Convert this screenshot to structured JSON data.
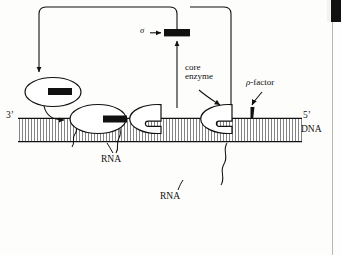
{
  "figure": {
    "background_color": "#fdfdfc",
    "ink_color": "#111111"
  },
  "labels": {
    "sigma": "σ",
    "core_enzyme": "core\nenzyme",
    "core_enzyme_line1": "core",
    "core_enzyme_line2": "enzyme",
    "rho_symbol": "ρ",
    "rho_suffix": "-factor",
    "three_prime": "3’",
    "five_prime": "5’",
    "dna": "DNA",
    "rna_left": "RNA",
    "rna_right": "RNA"
  },
  "elements": {
    "sigma_bar_color": "#111111",
    "rho_wedge_color": "#111111",
    "dna_fill": "#ffffff",
    "dna_rung_color": "#6e6e6e",
    "polymerase_fill": "#ffffff",
    "polymerase_stroke": "#111111"
  },
  "polymerases": [
    {
      "name": "free-holoenzyme",
      "state": "free with sigma",
      "has_sigma": true,
      "on_dna": false
    },
    {
      "name": "initiating-polymerase",
      "state": "bound with sigma",
      "has_sigma": true,
      "on_dna": true
    },
    {
      "name": "elongating-polymerase",
      "state": "core enzyme elongating",
      "has_sigma": false,
      "on_dna": true
    },
    {
      "name": "terminating-polymerase",
      "state": "core enzyme at rho-factor",
      "has_sigma": false,
      "on_dna": true
    }
  ],
  "panel": {
    "right_rule_color": "#b9b9b4",
    "corner_block_color": "#111111"
  }
}
